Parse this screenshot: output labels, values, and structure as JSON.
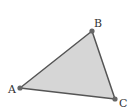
{
  "diagram": {
    "type": "triangle",
    "fill_color": "#d6d6d6",
    "stroke_color": "#555555",
    "vertex_color": "#666666",
    "vertices": [
      {
        "id": "A",
        "label": "A",
        "x": 20,
        "y": 88,
        "label_x": 8,
        "label_y": 93
      },
      {
        "id": "B",
        "label": "B",
        "x": 92,
        "y": 31,
        "label_x": 94,
        "label_y": 27
      },
      {
        "id": "C",
        "label": "C",
        "x": 115,
        "y": 99,
        "label_x": 119,
        "label_y": 107
      }
    ]
  }
}
